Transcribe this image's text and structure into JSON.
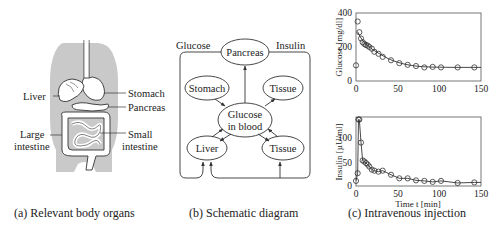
{
  "panel_a": {
    "caption": "(a) Relevant body organs",
    "labels": {
      "liver": "Liver",
      "stomach": "Stomach",
      "pancreas": "Pancreas",
      "large_intestine_1": "Large",
      "large_intestine_2": "intestine",
      "small_intestine_1": "Small",
      "small_intestine_2": "intestine"
    },
    "colors": {
      "body": "#c8c8c8",
      "organ": "#ffffff",
      "stroke": "#333333"
    }
  },
  "panel_b": {
    "caption": "(b) Schematic diagram",
    "edge_labels": {
      "glucose": "Glucose",
      "insulin": "Insulin"
    },
    "nodes": {
      "pancreas": "Pancreas",
      "stomach": "Stomach",
      "tissue_top": "Tissue",
      "glucose_1": "Glucose",
      "glucose_2": "in blood",
      "liver": "Liver",
      "tissue_bottom": "Tissue"
    }
  },
  "panel_c": {
    "caption": "(c) Intravenous injection",
    "top_plot": {
      "ylabel": "Glucose [mg/dl]",
      "yticks": [
        "0",
        "200",
        "400"
      ],
      "xticks": [
        "0",
        "50",
        "100",
        "150"
      ]
    },
    "bottom_plot": {
      "ylabel": "Insulin [µU/ml]",
      "yticks": [
        "0",
        "50",
        "100"
      ],
      "xticks": [
        "0",
        "50",
        "100",
        "150"
      ],
      "xlabel": "Time t [min]"
    }
  },
  "chart_data": [
    {
      "type": "scatter",
      "title": "",
      "xlabel": "",
      "ylabel": "Glucose [mg/dl]",
      "xlim": [
        0,
        150
      ],
      "ylim": [
        0,
        400
      ],
      "grid": false,
      "series": [
        {
          "name": "measured",
          "x": [
            0,
            2,
            4,
            6,
            8,
            10,
            12,
            14,
            16,
            19,
            22,
            27,
            32,
            42,
            52,
            62,
            72,
            82,
            92,
            102,
            122,
            142
          ],
          "y": [
            92,
            350,
            287,
            250,
            228,
            218,
            212,
            208,
            200,
            190,
            172,
            160,
            142,
            122,
            105,
            95,
            88,
            80,
            83,
            80,
            80,
            80
          ]
        },
        {
          "name": "model fit",
          "x": [
            2,
            5,
            10,
            20,
            30,
            40,
            50,
            60,
            70,
            80,
            90,
            100,
            120,
            150
          ],
          "y": [
            290,
            260,
            225,
            185,
            155,
            128,
            110,
            97,
            89,
            84,
            82,
            81,
            80,
            80
          ]
        }
      ]
    },
    {
      "type": "line",
      "title": "",
      "xlabel": "Time t [min]",
      "ylabel": "Insulin [µU/ml]",
      "xlim": [
        0,
        150
      ],
      "ylim": [
        0,
        135
      ],
      "grid": false,
      "series": [
        {
          "name": "measured",
          "x": [
            0,
            2,
            3,
            4,
            6,
            8,
            10,
            12,
            14,
            16,
            19,
            22,
            27,
            32,
            42,
            52,
            62,
            72,
            82,
            92,
            102,
            122,
            142
          ],
          "y": [
            10,
            25,
            130,
            130,
            85,
            50,
            48,
            45,
            42,
            38,
            32,
            30,
            28,
            30,
            22,
            15,
            15,
            11,
            10,
            8,
            10,
            6,
            7
          ]
        }
      ]
    }
  ]
}
